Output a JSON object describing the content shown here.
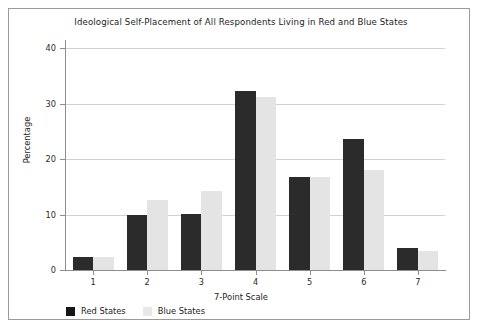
{
  "chart_data": {
    "type": "bar",
    "title": "Ideological Self-Placement of All Respondents Living in Red and Blue States",
    "xlabel": "7-Point Scale",
    "ylabel": "Percentage",
    "categories": [
      "1",
      "2",
      "3",
      "4",
      "5",
      "6",
      "7"
    ],
    "series": [
      {
        "name": "Red States",
        "color": "#2b2b2b",
        "values": [
          2.4,
          10.0,
          10.1,
          32.3,
          16.8,
          23.6,
          3.9
        ]
      },
      {
        "name": "Blue States",
        "color": "#e4e4e4",
        "values": [
          2.4,
          12.7,
          14.3,
          31.3,
          16.7,
          18.0,
          3.4
        ]
      }
    ],
    "ylim": [
      0,
      41.5
    ],
    "yticks": [
      0,
      10,
      20,
      30,
      40
    ],
    "ytick_labels": [
      "0",
      "10",
      "20",
      "30",
      "40"
    ],
    "grid": "horizontal",
    "legend_position": "bottom-left"
  },
  "legend": {
    "items": [
      {
        "label": "Red States"
      },
      {
        "label": "Blue States"
      }
    ]
  }
}
